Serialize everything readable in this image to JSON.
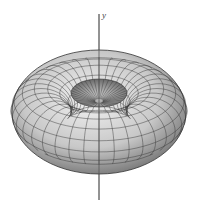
{
  "figure": {
    "axis_label": "y",
    "mesh": {
      "major_segments": 36,
      "minor_segments": 14
    },
    "colors": {
      "surface_light": "#e6e6e6",
      "surface_dark": "#7a7a7a",
      "mesh": "#333333",
      "axis": "#555555"
    }
  }
}
